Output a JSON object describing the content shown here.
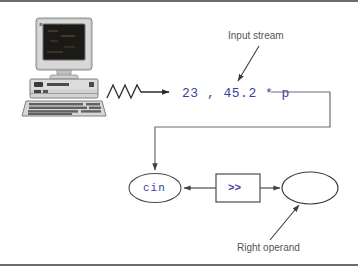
{
  "diagram": {
    "background_color": "#ffffff",
    "line_color": "#5a5a66",
    "text_blue": "#3a3f9e",
    "annotation_gray": "#555555",
    "border_color": "#6b6b6b"
  },
  "nodes": {
    "computer": {
      "name": "desktop-computer",
      "label": ""
    },
    "input_stream": {
      "value": "23 , 45.2 * p",
      "annotation": "Input stream"
    },
    "cin": {
      "label": "cin"
    },
    "operator": {
      "label": ">>"
    },
    "right_operand": {
      "label": "",
      "annotation": "Right operand"
    }
  },
  "connectors": {
    "keyboard_to_stream": "zigzag-arrow",
    "stream_to_cin": "elbow-arrow",
    "operator_to_cin": "left-arrow",
    "operator_to_operand": "right-arrow",
    "input_stream_pointer": "diagonal-arrow",
    "right_operand_pointer": "diagonal-arrow"
  }
}
